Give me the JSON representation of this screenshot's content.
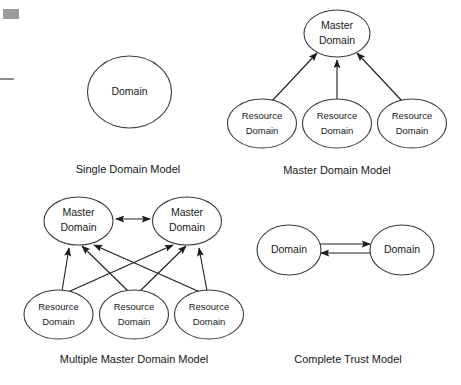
{
  "page": {
    "background": "#ffffff",
    "width": 461,
    "height": 385,
    "ink_color": "#1d1d1d",
    "ellipse_stroke": "#3a3a3a",
    "text_color": "#171717"
  },
  "artifacts": {
    "corner_block_label": "scan-artifact-block",
    "edge_line_label": "scan-artifact-line"
  },
  "diagrams": [
    {
      "id": "single-domain-model",
      "caption": "Single Domain Model",
      "nodes": [
        {
          "id": "sd-domain",
          "lines": [
            "Domain"
          ],
          "cx": 129.5,
          "cy": 92,
          "rx": 42,
          "ry": 36
        }
      ],
      "edges": []
    },
    {
      "id": "master-domain-model",
      "caption": "Master Domain Model",
      "nodes": [
        {
          "id": "md-master",
          "lines": [
            "Master",
            "Domain"
          ],
          "cx": 337,
          "cy": 33.5,
          "rx": 33,
          "ry": 23.5
        },
        {
          "id": "md-res-1",
          "lines": [
            "Resource",
            "Domain"
          ],
          "cx": 262,
          "cy": 123.5,
          "rx": 34.5,
          "ry": 24.5
        },
        {
          "id": "md-res-2",
          "lines": [
            "Resource",
            "Domain"
          ],
          "cx": 337,
          "cy": 123.5,
          "rx": 34.5,
          "ry": 24.5
        },
        {
          "id": "md-res-3",
          "lines": [
            "Resource",
            "Domain"
          ],
          "cx": 412,
          "cy": 123.5,
          "rx": 34.5,
          "ry": 24.5
        }
      ],
      "edges": [
        {
          "from": "md-res-1",
          "to": "md-master",
          "arrow": "single"
        },
        {
          "from": "md-res-2",
          "to": "md-master",
          "arrow": "single"
        },
        {
          "from": "md-res-3",
          "to": "md-master",
          "arrow": "single"
        }
      ]
    },
    {
      "id": "multiple-master-domain-model",
      "caption": "Multiple Master Domain Model",
      "nodes": [
        {
          "id": "mm-master-l",
          "lines": [
            "Master",
            "Domain"
          ],
          "cx": 78.5,
          "cy": 221,
          "rx": 34.5,
          "ry": 24
        },
        {
          "id": "mm-master-r",
          "lines": [
            "Master",
            "Domain"
          ],
          "cx": 187,
          "cy": 221,
          "rx": 34.5,
          "ry": 24
        },
        {
          "id": "mm-res-1",
          "lines": [
            "Resource",
            "Domain"
          ],
          "cx": 58.5,
          "cy": 314.5,
          "rx": 34.5,
          "ry": 24.5
        },
        {
          "id": "mm-res-2",
          "lines": [
            "Resource",
            "Domain"
          ],
          "cx": 134,
          "cy": 314.5,
          "rx": 34.5,
          "ry": 24.5
        },
        {
          "id": "mm-res-3",
          "lines": [
            "Resource",
            "Domain"
          ],
          "cx": 209,
          "cy": 314.5,
          "rx": 34.5,
          "ry": 24.5
        }
      ],
      "edges": [
        {
          "from": "mm-master-l",
          "to": "mm-master-r",
          "arrow": "double"
        },
        {
          "from": "mm-res-1",
          "to": "mm-master-l",
          "arrow": "single"
        },
        {
          "from": "mm-res-1",
          "to": "mm-master-r",
          "arrow": "single"
        },
        {
          "from": "mm-res-2",
          "to": "mm-master-l",
          "arrow": "single"
        },
        {
          "from": "mm-res-2",
          "to": "mm-master-r",
          "arrow": "single"
        },
        {
          "from": "mm-res-3",
          "to": "mm-master-l",
          "arrow": "single"
        },
        {
          "from": "mm-res-3",
          "to": "mm-master-r",
          "arrow": "single"
        }
      ]
    },
    {
      "id": "complete-trust-model",
      "caption": "Complete Trust Model",
      "nodes": [
        {
          "id": "ct-domain-l",
          "lines": [
            "Domain"
          ],
          "cx": 289,
          "cy": 250,
          "rx": 32,
          "ry": 25
        },
        {
          "id": "ct-domain-r",
          "lines": [
            "Domain"
          ],
          "cx": 402,
          "cy": 250,
          "rx": 32,
          "ry": 25
        }
      ],
      "edges": [
        {
          "from": "ct-domain-l",
          "to": "ct-domain-r",
          "arrow": "single"
        },
        {
          "from": "ct-domain-r",
          "to": "ct-domain-l",
          "arrow": "single"
        }
      ]
    }
  ],
  "labels": {
    "single_domain": "Domain",
    "master_line1": "Master",
    "master_line2": "Domain",
    "resource_line1": "Resource",
    "resource_line2": "Domain",
    "caption_single": "Single Domain Model",
    "caption_master": "Master Domain Model",
    "caption_multiple": "Multiple Master Domain Model",
    "caption_complete": "Complete Trust Model",
    "ct_domain_left": "Domain",
    "ct_domain_right": "Domain"
  }
}
